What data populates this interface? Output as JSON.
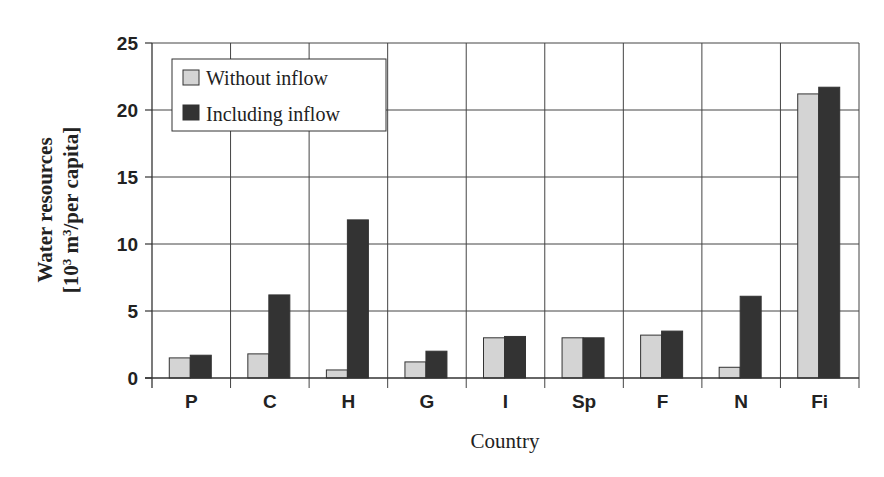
{
  "chart_data": {
    "type": "bar",
    "title": "",
    "xlabel": "Country",
    "ylabel_line1": "Water resources",
    "ylabel_line2_prefix": "[10",
    "ylabel_line2_sup1": "3",
    "ylabel_line2_mid": " m",
    "ylabel_line2_sup2": "3",
    "ylabel_line2_suffix": "/per capita]",
    "ylabel": "Water resources [10^3 m^3/per capita]",
    "ylim": [
      0,
      25
    ],
    "yticks": [
      0,
      5,
      10,
      15,
      20,
      25
    ],
    "grid": true,
    "legend_position": "upper-left-inside",
    "categories": [
      "P",
      "C",
      "H",
      "G",
      "I",
      "Sp",
      "F",
      "N",
      "Fi"
    ],
    "series": [
      {
        "name": "Without inflow",
        "color": "#d4d4d4",
        "values": [
          1.5,
          1.8,
          0.6,
          1.2,
          3.0,
          3.0,
          3.2,
          0.8,
          21.2
        ]
      },
      {
        "name": "Including inflow",
        "color": "#333333",
        "values": [
          1.7,
          6.2,
          11.8,
          2.0,
          3.1,
          3.0,
          3.5,
          6.1,
          21.7
        ]
      }
    ]
  }
}
